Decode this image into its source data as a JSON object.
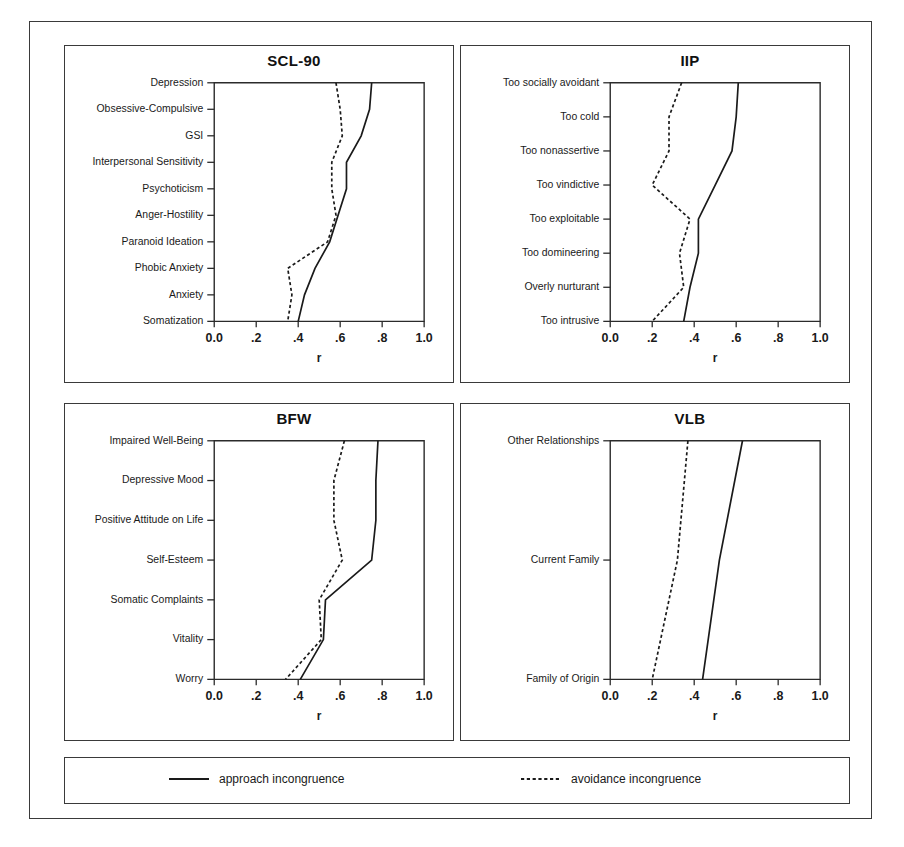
{
  "figure": {
    "axis_label": "r",
    "x_ticks": [
      "0.0",
      ".2",
      ".4",
      ".6",
      ".8",
      "1.0"
    ],
    "x_tick_values": [
      0.0,
      0.2,
      0.4,
      0.6,
      0.8,
      1.0
    ]
  },
  "legend": {
    "items": [
      {
        "label": "approach incongruence",
        "style": "solid",
        "icon": "solid-line-icon"
      },
      {
        "label": "avoidance incongruence",
        "style": "dashed",
        "icon": "dashed-line-icon"
      }
    ]
  },
  "panels": [
    {
      "id": "scl90",
      "title": "SCL-90"
    },
    {
      "id": "iip",
      "title": "IIP"
    },
    {
      "id": "bfw",
      "title": "BFW"
    },
    {
      "id": "vlb",
      "title": "VLB"
    }
  ],
  "chart_data": [
    {
      "type": "line",
      "title": "SCL-90",
      "orientation": "horizontal",
      "xlabel": "r",
      "ylabel": "",
      "xlim": [
        0.0,
        1.0
      ],
      "grid": false,
      "legend_position": "bottom",
      "categories": [
        "Depression",
        "Obsessive-Compulsive",
        "GSI",
        "Interpersonal Sensitivity",
        "Psychoticism",
        "Anger-Hostility",
        "Paranoid Ideation",
        "Phobic Anxiety",
        "Anxiety",
        "Somatization"
      ],
      "series": [
        {
          "name": "approach incongruence",
          "style": "solid",
          "values": [
            0.75,
            0.74,
            0.7,
            0.63,
            0.63,
            0.59,
            0.55,
            0.48,
            0.43,
            0.4
          ]
        },
        {
          "name": "avoidance incongruence",
          "style": "dashed",
          "values": [
            0.58,
            0.6,
            0.61,
            0.56,
            0.56,
            0.58,
            0.54,
            0.35,
            0.37,
            0.35
          ]
        }
      ]
    },
    {
      "type": "line",
      "title": "IIP",
      "orientation": "horizontal",
      "xlabel": "r",
      "ylabel": "",
      "xlim": [
        0.0,
        1.0
      ],
      "grid": false,
      "legend_position": "bottom",
      "categories": [
        "Too socially avoidant",
        "Too cold",
        "Too nonassertive",
        "Too vindictive",
        "Too exploitable",
        "Too domineering",
        "Overly nurturant",
        "Too intrusive"
      ],
      "series": [
        {
          "name": "approach incongruence",
          "style": "solid",
          "values": [
            0.61,
            0.6,
            0.58,
            0.5,
            0.42,
            0.42,
            0.38,
            0.35
          ]
        },
        {
          "name": "avoidance incongruence",
          "style": "dashed",
          "values": [
            0.34,
            0.28,
            0.28,
            0.2,
            0.38,
            0.33,
            0.35,
            0.2
          ]
        }
      ]
    },
    {
      "type": "line",
      "title": "BFW",
      "orientation": "horizontal",
      "xlabel": "r",
      "ylabel": "",
      "xlim": [
        0.0,
        1.0
      ],
      "grid": false,
      "legend_position": "bottom",
      "categories": [
        "Impaired Well-Being",
        "Depressive Mood",
        "Positive Attitude on Life",
        "Self-Esteem",
        "Somatic Complaints",
        "Vitality",
        "Worry"
      ],
      "series": [
        {
          "name": "approach incongruence",
          "style": "solid",
          "values": [
            0.78,
            0.77,
            0.77,
            0.75,
            0.53,
            0.52,
            0.41
          ]
        },
        {
          "name": "avoidance incongruence",
          "style": "dashed",
          "values": [
            0.62,
            0.57,
            0.57,
            0.61,
            0.5,
            0.51,
            0.34
          ]
        }
      ]
    },
    {
      "type": "line",
      "title": "VLB",
      "orientation": "horizontal",
      "xlabel": "r",
      "ylabel": "",
      "xlim": [
        0.0,
        1.0
      ],
      "grid": false,
      "legend_position": "bottom",
      "categories": [
        "Other Relationships",
        "Current Family",
        "Family of Origin"
      ],
      "series": [
        {
          "name": "approach incongruence",
          "style": "solid",
          "values": [
            0.63,
            0.52,
            0.44
          ]
        },
        {
          "name": "avoidance incongruence",
          "style": "dashed",
          "values": [
            0.37,
            0.32,
            0.2
          ]
        }
      ]
    }
  ]
}
